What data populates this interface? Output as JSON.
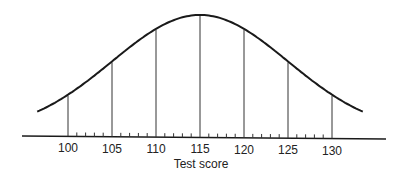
{
  "chart_data": {
    "type": "line",
    "title": "",
    "xlabel": "Test score",
    "ylabel": "",
    "mean": 115,
    "sd": 10,
    "x_ticks_major": [
      100,
      105,
      110,
      115,
      120,
      125,
      130
    ],
    "x_tick_labels": [
      "100",
      "105",
      "110",
      "115",
      "120",
      "125",
      "130"
    ],
    "minor_ticks_per_interval": 4,
    "xlim": [
      95,
      135
    ],
    "grid": false,
    "legend": null,
    "vertical_lines_at": [
      100,
      105,
      110,
      115,
      120,
      125,
      130
    ],
    "relative_density_at_lines": [
      0.32,
      0.61,
      0.88,
      1.0,
      0.88,
      0.61,
      0.32
    ]
  },
  "colors": {
    "line": "#1a1a1a",
    "background": "#ffffff"
  }
}
